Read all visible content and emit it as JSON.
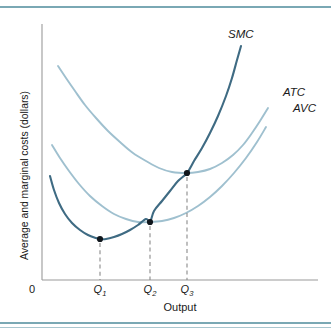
{
  "figure": {
    "background": "#ffffff",
    "rule_color": "#7aa8b4",
    "axis_color": "#9a9a9a"
  },
  "chart_data": {
    "type": "line",
    "title": "",
    "xlabel": "Output",
    "ylabel": "Average and marginal costs (dollars)",
    "origin_label": "0",
    "grid": false,
    "legend_position": "inline-curve-end-labels",
    "axis_ranges": {
      "x": [
        0,
        10
      ],
      "y": [
        0,
        10
      ]
    },
    "x_tick_labels": [
      "Q",
      "Q",
      "Q"
    ],
    "x_tick_subscripts": [
      "1",
      "2",
      "3"
    ],
    "x_tick_values": [
      2.15,
      4.25,
      5.85
    ],
    "series": [
      {
        "name": "SMC",
        "label": "SMC",
        "color": "#3f6b83",
        "label_x": 228,
        "label_y": 30,
        "points": [
          [
            50,
            168
          ],
          [
            54,
            182
          ],
          [
            59,
            195
          ],
          [
            65,
            206
          ],
          [
            72,
            215
          ],
          [
            80,
            222
          ],
          [
            88,
            227
          ],
          [
            96,
            230
          ],
          [
            100,
            231
          ],
          [
            106,
            231
          ],
          [
            114,
            229
          ],
          [
            122,
            226
          ],
          [
            130,
            222
          ],
          [
            138,
            217
          ],
          [
            146,
            211
          ],
          [
            150,
            214
          ],
          [
            154,
            203
          ],
          [
            162,
            193
          ],
          [
            170,
            183
          ],
          [
            178,
            173
          ],
          [
            187,
            165
          ],
          [
            194,
            153
          ],
          [
            202,
            140
          ],
          [
            210,
            125
          ],
          [
            218,
            108
          ],
          [
            226,
            88
          ],
          [
            232,
            70
          ],
          [
            237,
            52
          ],
          [
            241,
            38
          ]
        ]
      },
      {
        "name": "ATC",
        "label": "ATC",
        "color": "#9fc0cf",
        "label_x": 283,
        "label_y": 88,
        "points": [
          [
            58,
            58
          ],
          [
            66,
            70
          ],
          [
            75,
            83
          ],
          [
            85,
            97
          ],
          [
            96,
            110
          ],
          [
            108,
            123
          ],
          [
            120,
            134
          ],
          [
            133,
            145
          ],
          [
            146,
            153
          ],
          [
            159,
            160
          ],
          [
            172,
            164
          ],
          [
            187,
            165
          ],
          [
            198,
            164
          ],
          [
            210,
            161
          ],
          [
            222,
            155
          ],
          [
            233,
            147
          ],
          [
            243,
            137
          ],
          [
            252,
            125
          ],
          [
            260,
            113
          ],
          [
            268,
            100
          ]
        ]
      },
      {
        "name": "AVC",
        "label": "AVC",
        "color": "#9fc0cf",
        "label_x": 293,
        "label_y": 104,
        "points": [
          [
            52,
            137
          ],
          [
            60,
            150
          ],
          [
            69,
            163
          ],
          [
            79,
            176
          ],
          [
            90,
            188
          ],
          [
            102,
            198
          ],
          [
            114,
            206
          ],
          [
            126,
            211
          ],
          [
            138,
            214
          ],
          [
            150,
            214
          ],
          [
            162,
            213
          ],
          [
            174,
            210
          ],
          [
            186,
            205
          ],
          [
            198,
            198
          ],
          [
            210,
            189
          ],
          [
            222,
            178
          ],
          [
            234,
            165
          ],
          [
            246,
            150
          ],
          [
            257,
            134
          ],
          [
            266,
            119
          ]
        ]
      }
    ],
    "annotated_points": [
      {
        "name": "smc-minimum",
        "label": "Q1",
        "x": 100,
        "y": 231
      },
      {
        "name": "smc-avc-intersection",
        "label": "Q2",
        "x": 150,
        "y": 214
      },
      {
        "name": "smc-atc-intersection",
        "label": "Q3",
        "x": 187,
        "y": 165
      }
    ],
    "axis_pixels": {
      "origin_x": 42,
      "origin_y": 272,
      "x_end": 318,
      "y_top": 16
    }
  }
}
